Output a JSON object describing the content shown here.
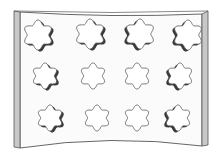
{
  "illustration": {
    "subject": "curved panel with flower-shaped cutouts",
    "width": 224,
    "height": 155,
    "colors": {
      "background": "#ffffff",
      "panel_fill": "#fbfbfb",
      "outline": "#555555",
      "side_strip": "#c8c8c8",
      "shadow": "#3a3a3a"
    },
    "panel": {
      "top_left": [
        20,
        12
      ],
      "top_right": [
        202,
        14
      ],
      "bottom_left": [
        20,
        148
      ],
      "bottom_right": [
        202,
        146
      ],
      "top_sag": 6,
      "bottom_sag": 7,
      "side_strip_width": 6
    },
    "cutouts": [
      {
        "row": 1,
        "col": 1,
        "cx": 38,
        "cy": 35,
        "r": 15,
        "shadow": "right"
      },
      {
        "row": 1,
        "col": 2,
        "cx": 90,
        "cy": 34,
        "r": 15,
        "shadow": "right"
      },
      {
        "row": 1,
        "col": 3,
        "cx": 140,
        "cy": 34,
        "r": 15,
        "shadow": "left"
      },
      {
        "row": 1,
        "col": 4,
        "cx": 188,
        "cy": 35,
        "r": 15,
        "shadow": "left"
      },
      {
        "row": 2,
        "col": 1,
        "cx": 45,
        "cy": 76,
        "r": 13,
        "shadow": "right"
      },
      {
        "row": 2,
        "col": 2,
        "cx": 93,
        "cy": 76,
        "r": 13,
        "shadow": "none"
      },
      {
        "row": 2,
        "col": 3,
        "cx": 137,
        "cy": 76,
        "r": 13,
        "shadow": "none"
      },
      {
        "row": 2,
        "col": 4,
        "cx": 180,
        "cy": 76,
        "r": 13,
        "shadow": "left"
      },
      {
        "row": 3,
        "col": 1,
        "cx": 50,
        "cy": 118,
        "r": 13,
        "shadow": "right"
      },
      {
        "row": 3,
        "col": 2,
        "cx": 97,
        "cy": 118,
        "r": 13,
        "shadow": "none"
      },
      {
        "row": 3,
        "col": 3,
        "cx": 137,
        "cy": 118,
        "r": 13,
        "shadow": "none"
      },
      {
        "row": 3,
        "col": 4,
        "cx": 178,
        "cy": 118,
        "r": 13,
        "shadow": "left"
      }
    ]
  }
}
